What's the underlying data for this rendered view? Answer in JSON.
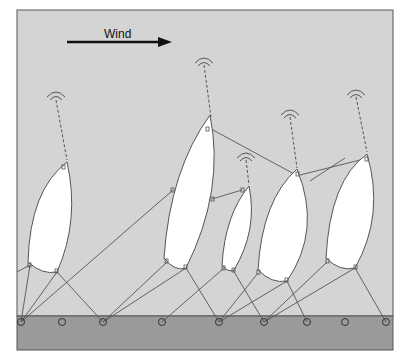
{
  "wind": {
    "label": "Wind",
    "direction": "right"
  },
  "colors": {
    "sky": "#d4d4d4",
    "ground": "#9a9a9a",
    "frame": "#555555",
    "kite_fill": "#ffffff",
    "line": "#444444"
  },
  "ground_anchor_count": 9,
  "kite_count": 6,
  "kites": [
    {
      "id": "kite-1",
      "signal_icon": "antenna-signal-icon"
    },
    {
      "id": "kite-2",
      "signal_icon": "antenna-signal-icon"
    },
    {
      "id": "kite-3",
      "signal_icon": "antenna-signal-icon"
    },
    {
      "id": "kite-4",
      "signal_icon": "antenna-signal-icon"
    },
    {
      "id": "kite-5",
      "signal_icon": "antenna-signal-icon"
    }
  ]
}
